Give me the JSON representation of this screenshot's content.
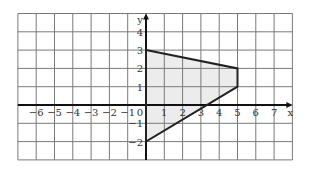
{
  "chart_data": {
    "type": "diagram",
    "title": "",
    "xlabel": "x",
    "ylabel": "y",
    "xlim": [
      -7,
      8
    ],
    "ylim": [
      -3,
      5
    ],
    "grid": true,
    "x_ticks": [
      "-6",
      "-5",
      "-4",
      "-3",
      "-2",
      "-1",
      "0",
      "1",
      "2",
      "3",
      "4",
      "5",
      "6",
      "7"
    ],
    "y_ticks": [
      "4",
      "3",
      "2",
      "1",
      "-1",
      "-2"
    ],
    "polygon": {
      "vertices": [
        [
          0,
          3
        ],
        [
          5,
          2
        ],
        [
          5,
          1
        ],
        [
          0,
          -2
        ]
      ],
      "fill": "#ececec",
      "stroke": "#222222"
    }
  },
  "colors": {
    "grid": "#7a7a7a",
    "axis": "#111111",
    "fill": "#ececec"
  }
}
